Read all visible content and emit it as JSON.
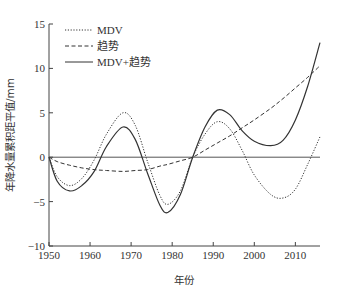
{
  "chart_data": {
    "type": "line",
    "title": "",
    "xlabel": "年份",
    "ylabel": "年降水量累积距平值/mm",
    "xlim": [
      1950,
      2016
    ],
    "ylim": [
      -10,
      15
    ],
    "xticks": [
      1950,
      1960,
      1970,
      1980,
      1990,
      2000,
      2010
    ],
    "yticks": [
      -10,
      -5,
      0,
      5,
      10,
      15
    ],
    "grid": false,
    "legend_position": "upper left",
    "reference_line": {
      "y": 0
    },
    "x": [
      1950,
      1952,
      1955,
      1958,
      1961,
      1964,
      1968,
      1971,
      1974,
      1977,
      1979,
      1982,
      1985,
      1988,
      1991,
      1994,
      1997,
      2000,
      2004,
      2007,
      2010,
      2013,
      2016
    ],
    "series": [
      {
        "name": "MDV",
        "style": "dotted",
        "values": [
          0,
          -2.2,
          -3.2,
          -2.4,
          -0.3,
          2.6,
          5.0,
          3.6,
          -0.5,
          -4.3,
          -5.3,
          -3.8,
          0.0,
          2.6,
          4.0,
          3.2,
          0.8,
          -2.0,
          -4.2,
          -4.6,
          -3.6,
          -0.8,
          2.3
        ]
      },
      {
        "name": "趋势",
        "style": "dashed",
        "values": [
          0,
          -0.5,
          -0.9,
          -1.2,
          -1.4,
          -1.5,
          -1.6,
          -1.5,
          -1.4,
          -1.0,
          -0.8,
          -0.4,
          0.0,
          0.8,
          1.6,
          2.4,
          3.3,
          4.2,
          5.5,
          6.6,
          7.8,
          9.0,
          10.3
        ]
      },
      {
        "name": "MDV+趋势",
        "style": "solid",
        "values": [
          0,
          -2.7,
          -3.8,
          -3.2,
          -1.6,
          1.2,
          3.4,
          2.0,
          -1.8,
          -5.4,
          -6.2,
          -4.2,
          0.0,
          3.4,
          5.3,
          4.8,
          3.0,
          1.8,
          1.3,
          1.9,
          4.2,
          8.0,
          12.9
        ]
      }
    ]
  },
  "legend": {
    "items": [
      {
        "label": "MDV",
        "style": "dotted"
      },
      {
        "label": "趋势",
        "style": "dashed"
      },
      {
        "label": "MDV+趋势",
        "style": "solid"
      }
    ]
  },
  "axes": {
    "xlabel": "年份",
    "ylabel": "年降水量累积距平值/mm"
  },
  "colors": {
    "line": "#333333",
    "axis": "#444444"
  }
}
